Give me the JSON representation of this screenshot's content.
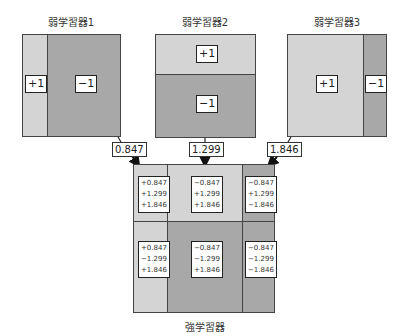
{
  "weak_learners": [
    {
      "title": "弱学習器1",
      "regions": [
        {
          "label": "+1",
          "shade": "light"
        },
        {
          "label": "−1",
          "shade": "dark"
        }
      ],
      "weight": "0.847"
    },
    {
      "title": "弱学習器2",
      "regions": [
        {
          "label": "+1",
          "shade": "light"
        },
        {
          "label": "−1",
          "shade": "dark"
        }
      ],
      "weight": "1.299"
    },
    {
      "title": "弱学習器3",
      "regions": [
        {
          "label": "+1",
          "shade": "light"
        },
        {
          "label": "−1",
          "shade": "dark"
        }
      ],
      "weight": "1.846"
    }
  ],
  "strong_learner": {
    "title": "強学習器",
    "cells": [
      {
        "lines": [
          "+0.847",
          "+1.299",
          "+1.846"
        ],
        "shade": "light"
      },
      {
        "lines": [
          "−0.847",
          "+1.299",
          "+1.846"
        ],
        "shade": "light"
      },
      {
        "lines": [
          "−0.847",
          "+1.299",
          "−1.846"
        ],
        "shade": "dark"
      },
      {
        "lines": [
          "+0.847",
          "−1.299",
          "+1.846"
        ],
        "shade": "light"
      },
      {
        "lines": [
          "−0.847",
          "−1.299",
          "+1.846"
        ],
        "shade": "dark"
      },
      {
        "lines": [
          "−0.847",
          "−1.299",
          "−1.846"
        ],
        "shade": "dark"
      }
    ]
  },
  "colors": {
    "light": "#d4d4d4",
    "dark": "#a8a8a8",
    "border": "#444444"
  }
}
